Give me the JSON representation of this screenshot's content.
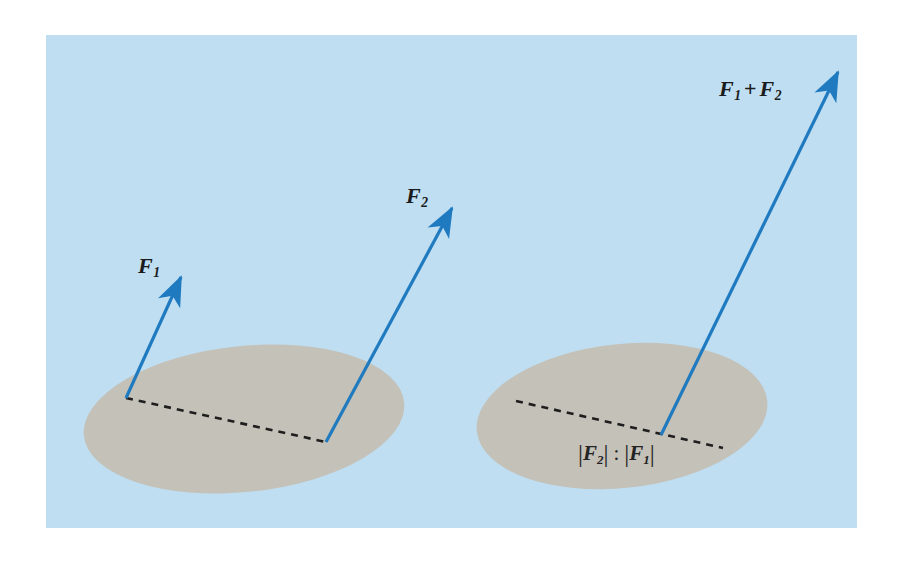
{
  "figure": {
    "canvas": {
      "width": 903,
      "height": 563
    },
    "colors": {
      "page_background": "#ffffff",
      "panel_background": "#bfdef2",
      "body_fill": "#c4c1b8",
      "vector_blue": "#1f7ac0",
      "dashed_line": "#1e1e1e",
      "label_text": "#1b1b1b"
    },
    "panel": {
      "x": 46,
      "y": 35,
      "width": 811,
      "height": 493
    }
  },
  "left_diagram": {
    "name": "two-separate-forces",
    "body": {
      "shape": "ellipse",
      "center_x": 244,
      "center_y": 419,
      "radius_x": 161,
      "radius_y": 73,
      "rotation_deg": -6
    },
    "dashed_line": {
      "x1": 126,
      "y1": 398,
      "x2": 326,
      "y2": 442
    },
    "vectors": [
      {
        "label": "F",
        "subscript": "1",
        "label_text": "F₁",
        "x1": 126,
        "y1": 398,
        "x2": 181,
        "y2": 277,
        "label_x": 138,
        "label_y": 255
      },
      {
        "label": "F",
        "subscript": "2",
        "label_text": "F₂",
        "x1": 326,
        "y1": 442,
        "x2": 452,
        "y2": 208,
        "label_x": 406,
        "label_y": 185
      }
    ]
  },
  "right_diagram": {
    "name": "resultant-force",
    "body": {
      "shape": "ellipse",
      "center_x": 622,
      "center_y": 416,
      "radius_x": 146,
      "radius_y": 72,
      "rotation_deg": -6
    },
    "dashed_line": {
      "x1": 516,
      "y1": 401,
      "x2": 723,
      "y2": 448
    },
    "application_point": {
      "x": 661,
      "y": 435
    },
    "ratio_annotation": {
      "text": "|F₂| : |F₁|",
      "numerator": "F",
      "numerator_sub": "2",
      "denominator": "F",
      "denominator_sub": "1",
      "separator": ":",
      "x": 578,
      "y": 442
    },
    "vectors": [
      {
        "label": "F₁ + F₂",
        "first_term": "F",
        "first_sub": "1",
        "operator": "+",
        "second_term": "F",
        "second_sub": "2",
        "x1": 661,
        "y1": 435,
        "x2": 838,
        "y2": 72,
        "label_x": 719,
        "label_y": 78
      }
    ]
  }
}
